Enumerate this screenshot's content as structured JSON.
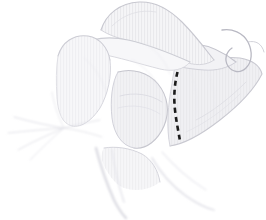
{
  "figure": {
    "title": "Anatomical line drawing of the shoulder girdle",
    "caption": "",
    "domain": "anatomical-illustration",
    "style": "faint pencil / stipple line drawing",
    "canvas": {
      "width": 266,
      "height": 220
    },
    "background_color": "#ffffff"
  },
  "palette": {
    "background": "#ffffff",
    "outline_faint": "#d9d9dd",
    "outline_mid": "#c6c6cc",
    "outline_soft": "#e6e6ea",
    "fill_pale": "#f4f4f6",
    "fill_pale_2": "#efeff2",
    "hatch": "#e2e2e7",
    "marker_black": "#1b1b1b"
  },
  "annotations": {
    "osteotomy_line": {
      "name": "dashed-osteotomy-line",
      "label": "",
      "color": "#1b1b1b",
      "stroke_width": 2.6,
      "dash_pattern": "5 4",
      "path": "M177.5,72 C174.5,84 173.5,97 175,110 C176.3,122 178.6,132 180,141"
    }
  },
  "structures": [
    {
      "id": "acromion-spine",
      "name": "acromion-and-scapular-spine",
      "fill": "#f4f4f6",
      "stroke": "#d4d4da",
      "path": "M101,30 C106,14 120,3 139,2 C156,1 170,10 182,22 C196,36 206,50 214,60 C206,66 194,66 183,61 C168,54 150,46 134,42 C121,39 110,36 101,30 Z"
    },
    {
      "id": "clavicle",
      "name": "clavicle",
      "fill": "#f6f6f8",
      "stroke": "#d9d9df",
      "path": "M78,46 C92,38 110,36 128,40 C150,45 172,54 190,62 C184,70 172,72 160,69 C140,64 118,57 100,54 C90,52 82,50 78,46 Z"
    },
    {
      "id": "coracoid",
      "name": "coracoid-process",
      "fill": "#f2f2f5",
      "stroke": "#cfcfd6",
      "path": "M159,60 C166,48 180,42 196,44 C212,46 226,54 236,62 C228,68 216,71 204,70 C188,69 172,66 159,60 Z"
    },
    {
      "id": "humeral-head",
      "name": "humeral-head",
      "fill": "#f6f6f8",
      "stroke": "#d6d6dc",
      "path": "M58,56 C62,42 74,34 88,36 C100,38 108,48 110,60 C112,76 108,94 100,108 C92,120 82,128 72,126 C62,124 58,112 57,98 C56,82 56,68 58,56 Z"
    },
    {
      "id": "glenoid",
      "name": "glenoid-fossa",
      "fill": "#f1f1f4",
      "stroke": "#cdcdd5",
      "path": "M118,72 C132,68 148,72 158,84 C168,96 170,112 164,126 C158,140 146,150 134,148 C122,146 114,134 112,118 C110,100 112,82 118,72 Z"
    },
    {
      "id": "scapula-body",
      "name": "scapula-body",
      "fill": "#f0f0f3",
      "stroke": "#cbcbd3",
      "path": "M176,64 C196,58 218,56 240,58 C252,60 260,66 262,74 C254,90 238,106 220,120 C202,134 184,144 170,146 C166,128 168,104 172,84 C173,76 174,69 176,64 Z"
    },
    {
      "id": "inferior-angle",
      "name": "inferior-angle-of-scapula",
      "fill": "#f6f6f8",
      "stroke": "#dadae0",
      "path": "M104,148 C116,146 130,148 142,154 C152,160 158,170 160,182 C150,190 136,192 124,188 C114,184 106,172 102,160 C101,155 102,151 104,148 Z"
    },
    {
      "id": "brachial-plexus",
      "name": "neurovascular-strands",
      "fill": "none",
      "stroke": "#e4e4e9",
      "path": "M64,128 L10,116 M64,128 L6,132 M64,128 L14,148 M64,128 L30,158 M64,128 L96,120 M64,128 L100,136"
    }
  ],
  "texture": {
    "name": "vertical-hatch",
    "spacing_px": 3,
    "color": "#e3e3e8",
    "opacity": 0.55
  },
  "labels": []
}
